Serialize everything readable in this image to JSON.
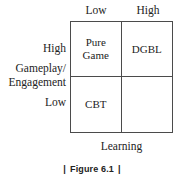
{
  "figure": {
    "caption_left_rule": "|",
    "caption_text": "Figure 6.1",
    "caption_right_rule": "|"
  },
  "axes": {
    "x_title": "Learning",
    "y_title_line1": "Gameplay/",
    "y_title_line2": "Engagement",
    "x_ticks": [
      "Low",
      "High"
    ],
    "y_ticks": [
      "High",
      "Low"
    ]
  },
  "matrix": {
    "cells": [
      {
        "id": "top-left",
        "label": "Pure\nGame",
        "x": "Low",
        "y": "High"
      },
      {
        "id": "top-right",
        "label": "DGBL",
        "x": "High",
        "y": "High"
      },
      {
        "id": "bottom-left",
        "label": "CBT",
        "x": "Low",
        "y": "Low"
      },
      {
        "id": "bottom-right",
        "label": "",
        "x": "High",
        "y": "Low"
      }
    ]
  },
  "chart_data": {
    "type": "table",
    "title": "Figure 6.1",
    "xlabel": "Learning",
    "ylabel": "Gameplay/Engagement",
    "x_categories": [
      "Low",
      "High"
    ],
    "y_categories": [
      "High",
      "Low"
    ],
    "cells": [
      [
        "Pure Game",
        "DGBL"
      ],
      [
        "CBT",
        ""
      ]
    ],
    "grid": true,
    "legend": "none"
  },
  "colors": {
    "background": "#ffffff",
    "border": "#4b4b4b",
    "text": "#232323",
    "caption_text": "#222222"
  }
}
